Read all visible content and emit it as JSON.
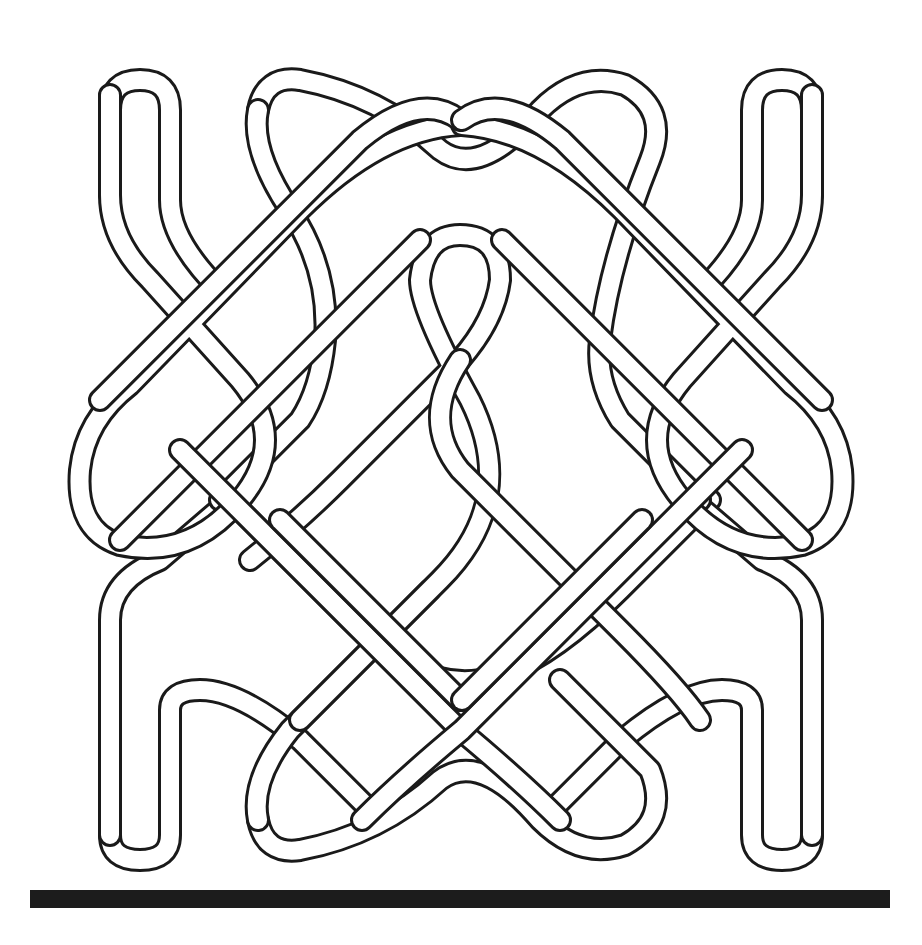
{
  "figure": {
    "type": "celtic-knot-line-drawing",
    "colors": {
      "background": "#ffffff",
      "outline": "#1a1a1a",
      "band_fill": "#ffffff",
      "base_bar": "#1c1c1c"
    }
  }
}
